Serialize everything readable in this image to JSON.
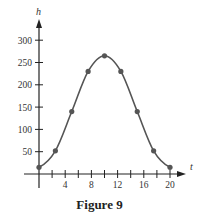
{
  "caption": "Figure 9",
  "chart_data": {
    "type": "line",
    "title": "",
    "caption": "Figure 9",
    "xlabel": "t",
    "ylabel": "h",
    "xlim": [
      0,
      21
    ],
    "ylim": [
      0,
      320
    ],
    "x_ticks": [
      2,
      4,
      6,
      8,
      10,
      12,
      14,
      16,
      18,
      20
    ],
    "x_tick_labels": [
      "4",
      "8",
      "12",
      "16",
      "20"
    ],
    "x_tick_label_values": [
      4,
      8,
      12,
      16,
      20
    ],
    "y_ticks": [
      50,
      100,
      150,
      200,
      250,
      300
    ],
    "y_tick_labels": [
      "50",
      "100",
      "150",
      "200",
      "250",
      "300"
    ],
    "grid": false,
    "legend": null,
    "series": [
      {
        "name": "h(t)",
        "style": "smooth curve with marked points",
        "x": [
          0,
          2.5,
          5,
          7.5,
          10,
          12.5,
          15,
          17.5,
          20
        ],
        "values": [
          15,
          52,
          140,
          230,
          265,
          230,
          140,
          52,
          15
        ]
      }
    ],
    "colors": {
      "curve": "#555555",
      "axis": "#222222",
      "text": "#333333"
    }
  }
}
